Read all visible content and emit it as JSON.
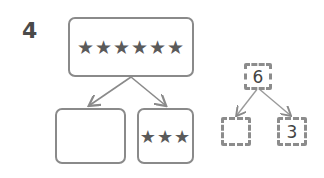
{
  "problem_number": "4",
  "star_diagram": {
    "top": {
      "stars": "★★★★★★",
      "count": 6
    },
    "left": {
      "stars": "",
      "count": null
    },
    "right": {
      "stars": "★★★",
      "count": 3
    }
  },
  "number_bond": {
    "whole": "6",
    "left_part": "",
    "right_part": "3"
  }
}
